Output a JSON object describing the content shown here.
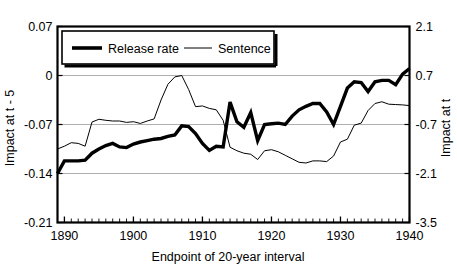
{
  "chart_data": {
    "type": "line",
    "title": "",
    "xlabel": "Endpoint of 20-year interval",
    "ylabel": "Impact at t - 5",
    "y2label": "Impact at t",
    "xlim": [
      1889,
      1940
    ],
    "ylim": [
      -0.21,
      0.07
    ],
    "y2lim": [
      -3.5,
      2.1
    ],
    "xticks": [
      1890,
      1900,
      1910,
      1920,
      1930,
      1940
    ],
    "xticklabels": [
      "1890",
      "1900",
      "1910",
      "1920",
      "1930",
      "1940"
    ],
    "yticks": [
      0.07,
      0,
      -0.07,
      -0.14,
      -0.21
    ],
    "yticklabels": [
      "0.07",
      "0",
      "-0.07",
      "-0.14",
      "-0.21"
    ],
    "y2ticks": [
      2.1,
      0.7,
      -0.7,
      -2.1,
      -3.5
    ],
    "y2ticklabels": [
      "2.1",
      "0.7",
      "-0.7",
      "-2.1",
      "-3.5"
    ],
    "grid": true,
    "legend_position": "upper-left",
    "minor_xticks_interval": 1,
    "series": [
      {
        "name": "Release rate",
        "axis": "left",
        "style": "thick",
        "color": "#000000",
        "x": [
          1889,
          1890,
          1891,
          1892,
          1893,
          1894,
          1895,
          1896,
          1897,
          1898,
          1899,
          1900,
          1901,
          1902,
          1903,
          1904,
          1905,
          1906,
          1907,
          1908,
          1909,
          1910,
          1911,
          1912,
          1913,
          1914,
          1915,
          1916,
          1917,
          1918,
          1919,
          1920,
          1921,
          1922,
          1923,
          1924,
          1925,
          1926,
          1927,
          1928,
          1929,
          1930,
          1931,
          1932,
          1933,
          1934,
          1935,
          1936,
          1937,
          1938,
          1939,
          1940
        ],
        "y": [
          -0.14,
          -0.122,
          -0.122,
          -0.122,
          -0.121,
          -0.111,
          -0.105,
          -0.1,
          -0.097,
          -0.102,
          -0.103,
          -0.098,
          -0.095,
          -0.093,
          -0.091,
          -0.09,
          -0.087,
          -0.085,
          -0.072,
          -0.073,
          -0.083,
          -0.097,
          -0.107,
          -0.101,
          -0.102,
          -0.038,
          -0.066,
          -0.074,
          -0.053,
          -0.093,
          -0.07,
          -0.069,
          -0.068,
          -0.07,
          -0.058,
          -0.049,
          -0.044,
          -0.04,
          -0.04,
          -0.052,
          -0.07,
          -0.044,
          -0.018,
          -0.009,
          -0.01,
          -0.023,
          -0.009,
          -0.007,
          -0.007,
          -0.013,
          0.002,
          0.01
        ]
      },
      {
        "name": "Sentence",
        "axis": "right",
        "style": "thin",
        "color": "#000000",
        "x": [
          1889,
          1890,
          1891,
          1892,
          1893,
          1894,
          1895,
          1896,
          1897,
          1898,
          1899,
          1900,
          1901,
          1902,
          1903,
          1904,
          1905,
          1906,
          1907,
          1908,
          1909,
          1910,
          1911,
          1912,
          1913,
          1914,
          1915,
          1916,
          1917,
          1918,
          1919,
          1920,
          1921,
          1922,
          1923,
          1924,
          1925,
          1926,
          1927,
          1928,
          1929,
          1930,
          1931,
          1932,
          1933,
          1934,
          1935,
          1936,
          1937,
          1938,
          1939,
          1940
        ],
        "y": [
          -1.4,
          -1.32,
          -1.22,
          -1.24,
          -1.32,
          -0.63,
          -0.55,
          -0.58,
          -0.6,
          -0.6,
          -0.64,
          -0.62,
          -0.67,
          -0.6,
          -0.54,
          0.0,
          0.45,
          0.66,
          0.7,
          0.3,
          -0.19,
          -0.17,
          -0.24,
          -0.28,
          -0.58,
          -1.35,
          -1.45,
          -1.52,
          -1.55,
          -1.7,
          -1.45,
          -1.42,
          -1.48,
          -1.58,
          -1.68,
          -1.78,
          -1.8,
          -1.74,
          -1.74,
          -1.76,
          -1.6,
          -1.2,
          -1.12,
          -0.72,
          -0.66,
          -0.3,
          -0.1,
          -0.05,
          -0.12,
          -0.13,
          -0.14,
          -0.16
        ]
      }
    ]
  },
  "legend": {
    "items": [
      {
        "label": "Release rate",
        "style": "thick"
      },
      {
        "label": "Sentence",
        "style": "thin"
      }
    ]
  },
  "axes": {
    "left_title": "Impact at t - 5",
    "right_title": "Impact at t",
    "bottom_title": "Endpoint of 20-year interval"
  }
}
